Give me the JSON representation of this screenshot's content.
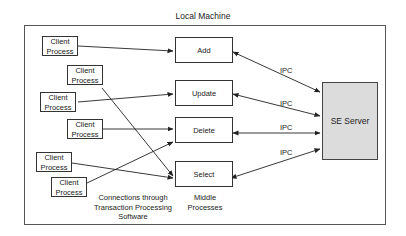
{
  "diagram": {
    "title": "Local Machine",
    "client_processes": [
      {
        "label": "Client\nProcess",
        "line1": "Client",
        "line2": "Process",
        "target": "Add"
      },
      {
        "label": "Client\nProcess",
        "line1": "Client",
        "line2": "Process",
        "target": "Select"
      },
      {
        "label": "Client\nProcess",
        "line1": "Client",
        "line2": "Process",
        "target": "Update"
      },
      {
        "label": "Client\nProcess",
        "line1": "Client",
        "line2": "Process",
        "target": "Delete"
      },
      {
        "label": "Client\nProcess",
        "line1": "Client",
        "line2": "Process",
        "target": "Select"
      },
      {
        "label": "Client\nProcess",
        "line1": "Client",
        "line2": "Process",
        "target": "Delete"
      }
    ],
    "middle_processes": [
      {
        "label": "Add"
      },
      {
        "label": "Update"
      },
      {
        "label": "Delete"
      },
      {
        "label": "Select"
      }
    ],
    "server": {
      "label": "SE Server"
    },
    "ipc_labels": [
      "IPC",
      "IPC",
      "IPC",
      "IPC"
    ],
    "annotations": {
      "connections_line1": "Connections through",
      "connections_line2": "Transaction Processing",
      "connections_line3": "Software",
      "middle_line1": "Middle",
      "middle_line2": "Processes"
    },
    "colors": {
      "server_fill": "#dcdcdc",
      "border": "#333333",
      "background": "#ffffff"
    }
  }
}
